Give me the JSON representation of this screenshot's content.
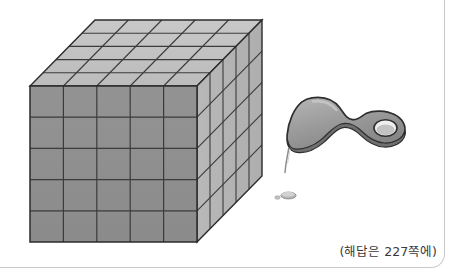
{
  "page": {
    "width": 455,
    "height": 274,
    "background": "#ffffff",
    "border_color": "#c9c9c9"
  },
  "caption": {
    "text": "(해답은 227쪽에)",
    "answer_page": "227",
    "color": "#3a3a3a"
  },
  "illustration": {
    "title": "5x5x5 cube being sliced by a peeler",
    "cube": {
      "divisions_width": 5,
      "divisions_height": 5,
      "divisions_depth": 5,
      "total_unit_cubes": 125,
      "face_colors": {
        "front": "#8f8f8f",
        "top": "#c2c2c2",
        "right": "#b4b4b4",
        "edge_line": "#3b3b3b",
        "outline": "#2b2b2b"
      },
      "geometry": {
        "front_left_x": 30,
        "front_right_x": 197,
        "front_top_y": 86,
        "front_bottom_y": 242,
        "depth_dx": 65,
        "depth_dy": -66
      }
    },
    "peeler": {
      "body_color": "#9a9a9a",
      "body_highlight": "#b9b9b9",
      "body_shadow": "#6d6d6d",
      "outline_color": "#2e2e2e",
      "blade_color": "#cfcfcf",
      "teeth_count": 11,
      "has_hanging_hole": true
    },
    "shaving": {
      "color": "#b0b0b0",
      "label": "cut-off sliver"
    }
  }
}
